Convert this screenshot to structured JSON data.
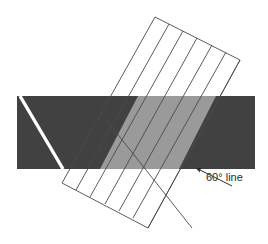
{
  "figure": {
    "canvas": {
      "width": 268,
      "height": 244,
      "background": "#ffffff"
    },
    "annotation": {
      "label": "60° line",
      "label_x": 206,
      "label_y": 181,
      "arrow_tip_x": 196,
      "arrow_tip_y": 168,
      "arrow_tail_x": 232,
      "arrow_tail_y": 186,
      "color": "#2b2b2b"
    },
    "band": {
      "name": "horizontal-dark-band",
      "x": 17,
      "y": 96,
      "width": 238,
      "height": 73,
      "fill": "#414141"
    },
    "overlap": {
      "name": "overlap-region",
      "fill": "#9a9a9a",
      "points": "138,96 216,96 179,169 100,169"
    },
    "rectangle": {
      "name": "rotated-striped-rectangle",
      "fill": "none",
      "stroke": "#4a4a4a",
      "stroke_width": 0.9,
      "corners": {
        "top_left": [
          155,
          17
        ],
        "top_right": [
          240,
          60
        ],
        "bottom_right": [
          148,
          228
        ],
        "bottom_left": [
          62,
          183
        ]
      },
      "stripe_count": 6,
      "stripes": [
        {
          "x1": 169,
          "y1": 24,
          "x2": 76,
          "y2": 190
        },
        {
          "x1": 183,
          "y1": 31,
          "x2": 90,
          "y2": 197
        },
        {
          "x1": 197,
          "y1": 38,
          "x2": 105,
          "y2": 204
        },
        {
          "x1": 212,
          "y1": 45,
          "x2": 119,
          "y2": 211
        },
        {
          "x1": 226,
          "y1": 52,
          "x2": 133,
          "y2": 218
        },
        {
          "x1": 240,
          "y1": 60,
          "x2": 148,
          "y2": 228
        }
      ]
    },
    "crossing_line": {
      "name": "crossing-diagonal-line",
      "x1": 100,
      "y1": 112,
      "x2": 192,
      "y2": 228,
      "stroke": "#4a4a4a",
      "stroke_width": 0.9
    },
    "white_line": {
      "name": "white-60-degree-line",
      "x1": 20,
      "y1": 96,
      "x2": 63,
      "y2": 169,
      "stroke": "#ffffff",
      "stroke_width": 3.4
    }
  }
}
